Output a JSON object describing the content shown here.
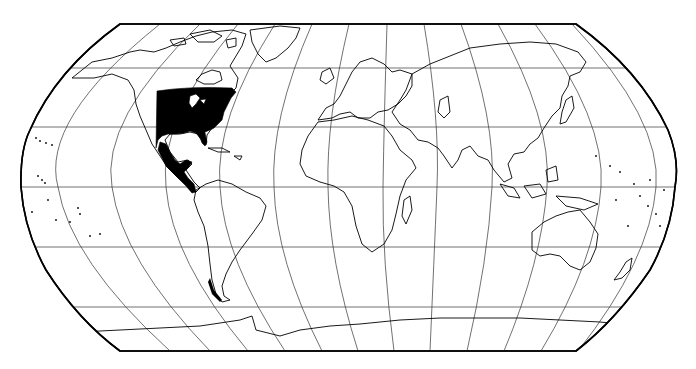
{
  "map": {
    "projection": "Robinson",
    "title": "",
    "background": "#ffffff",
    "outline_color": "#000000",
    "graticule_color": "#333333",
    "range_fill_color": "#000000",
    "graticule": {
      "parallel_y": [
        68,
        127,
        187,
        247,
        307
      ],
      "meridian_x_at_equator": [
        58,
        112,
        166,
        220,
        274,
        328,
        383,
        437,
        492,
        547,
        601,
        656
      ]
    },
    "highlighted_range": {
      "description": "Shaded distribution range",
      "regions": [
        "Eastern North America",
        "Mexico",
        "Central America"
      ]
    },
    "continents": [
      "North America",
      "South America",
      "Europe",
      "Africa",
      "Asia",
      "Australia",
      "Antarctica"
    ]
  }
}
